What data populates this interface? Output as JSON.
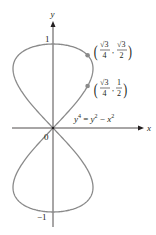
{
  "figure": {
    "equation": "y⁴ = y² − x²",
    "equation_parts": {
      "lhs_base": "y",
      "lhs_exp": "4",
      "eq": " = ",
      "r1_base": "y",
      "r1_exp": "2",
      "minus": " − ",
      "r2_base": "x",
      "r2_exp": "2"
    },
    "axes": {
      "x_label": "x",
      "y_label": "y",
      "origin_label": "0",
      "y_tick_top": "1",
      "y_tick_bottom": "−1"
    },
    "points": [
      {
        "label": "(√3/4, √3/2)",
        "x_num": "√3",
        "x_den": "4",
        "y_num": "√3",
        "y_den": "2",
        "x": 0.433,
        "y": 0.866
      },
      {
        "label": "(√3/4, 1/2)",
        "x_num": "√3",
        "x_den": "4",
        "y_num": "1",
        "y_den": "2",
        "x": 0.433,
        "y": 0.5
      }
    ],
    "colors": {
      "curve": "#8a8a8a",
      "axis": "#231f20",
      "point": "#8a8a8a",
      "text": "#231f20"
    }
  }
}
